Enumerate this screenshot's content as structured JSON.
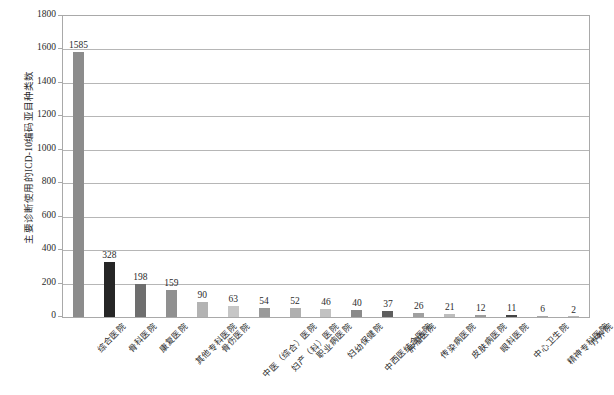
{
  "chart_data": {
    "type": "bar",
    "title": "",
    "xlabel": "",
    "ylabel": "主要诊断使用的ICD-10编码亚目种类数",
    "ylim": [
      0,
      1800
    ],
    "ytick_step": 200,
    "yticks": [
      "1800",
      "1600",
      "1400",
      "1200",
      "1000",
      "800",
      "600",
      "400",
      "200",
      "0"
    ],
    "grid": "horizontal",
    "legend": "none",
    "categories": [
      "综合医院",
      "骨科医院",
      "康复医院",
      "其他专科医院",
      "骨伤医院",
      "中医（综合）医院",
      "妇产（科）医院",
      "职业病医院",
      "妇幼保健院",
      "中西医结合医院",
      "肿瘤医院",
      "传染病医院",
      "皮肤病医院",
      "眼科医院",
      "中心卫生院",
      "精神专科医院",
      "疗养院"
    ],
    "values": [
      1585,
      328,
      198,
      159,
      90,
      63,
      54,
      52,
      46,
      40,
      37,
      26,
      21,
      12,
      11,
      6,
      2
    ],
    "bar_colors": [
      "#8c8c8c",
      "#262626",
      "#6e6e6e",
      "#909090",
      "#b3b3b3",
      "#c6c6c6",
      "#9a9a9a",
      "#b0b0b0",
      "#c2c2c2",
      "#8a8a8a",
      "#5e5e5e",
      "#a0a0a0",
      "#bdbdbd",
      "#9c9c9c",
      "#444444",
      "#a8a8a8",
      "#b8b8b8"
    ]
  }
}
